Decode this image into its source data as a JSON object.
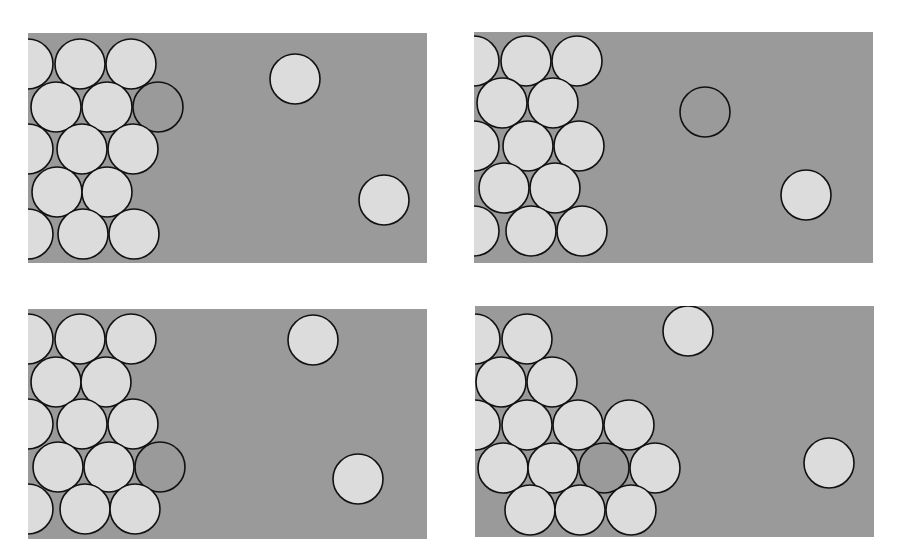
{
  "figure": {
    "width": 897,
    "height": 560,
    "colors": {
      "background": "#ffffff",
      "panel": "#9a9a9a",
      "atom_light": "#dcdcdc",
      "atom_dark": "#9a9a9a",
      "outline": "#111111"
    },
    "radius": 25,
    "panels": [
      {
        "name": "panel-top-left",
        "rect": {
          "x": 28,
          "y": 33,
          "w": 399,
          "h": 230
        },
        "atoms": [
          {
            "x": 28,
            "y": 64,
            "type": "light"
          },
          {
            "x": 80,
            "y": 64,
            "type": "light"
          },
          {
            "x": 131,
            "y": 64,
            "type": "light"
          },
          {
            "x": 56,
            "y": 107,
            "type": "light"
          },
          {
            "x": 107,
            "y": 107,
            "type": "light"
          },
          {
            "x": 158,
            "y": 107,
            "type": "dark"
          },
          {
            "x": 28,
            "y": 149,
            "type": "light"
          },
          {
            "x": 82,
            "y": 149,
            "type": "light"
          },
          {
            "x": 133,
            "y": 149,
            "type": "light"
          },
          {
            "x": 57,
            "y": 192,
            "type": "light"
          },
          {
            "x": 107,
            "y": 192,
            "type": "light"
          },
          {
            "x": 28,
            "y": 234,
            "type": "light"
          },
          {
            "x": 83,
            "y": 234,
            "type": "light"
          },
          {
            "x": 134,
            "y": 234,
            "type": "light"
          },
          {
            "x": 295,
            "y": 79,
            "type": "light"
          },
          {
            "x": 384,
            "y": 200,
            "type": "light"
          }
        ]
      },
      {
        "name": "panel-top-right",
        "rect": {
          "x": 474,
          "y": 32,
          "w": 399,
          "h": 231
        },
        "atoms": [
          {
            "x": 474,
            "y": 61,
            "type": "light"
          },
          {
            "x": 526,
            "y": 61,
            "type": "light"
          },
          {
            "x": 577,
            "y": 61,
            "type": "light"
          },
          {
            "x": 502,
            "y": 103,
            "type": "light"
          },
          {
            "x": 553,
            "y": 103,
            "type": "light"
          },
          {
            "x": 474,
            "y": 146,
            "type": "light"
          },
          {
            "x": 528,
            "y": 146,
            "type": "light"
          },
          {
            "x": 579,
            "y": 146,
            "type": "light"
          },
          {
            "x": 504,
            "y": 188,
            "type": "light"
          },
          {
            "x": 555,
            "y": 188,
            "type": "light"
          },
          {
            "x": 474,
            "y": 231,
            "type": "light"
          },
          {
            "x": 531,
            "y": 231,
            "type": "light"
          },
          {
            "x": 582,
            "y": 231,
            "type": "light"
          },
          {
            "x": 705,
            "y": 112,
            "type": "dark"
          },
          {
            "x": 806,
            "y": 195,
            "type": "light"
          }
        ]
      },
      {
        "name": "panel-bottom-left",
        "rect": {
          "x": 28,
          "y": 309,
          "w": 399,
          "h": 230
        },
        "atoms": [
          {
            "x": 28,
            "y": 339,
            "type": "light"
          },
          {
            "x": 80,
            "y": 339,
            "type": "light"
          },
          {
            "x": 131,
            "y": 339,
            "type": "light"
          },
          {
            "x": 56,
            "y": 382,
            "type": "light"
          },
          {
            "x": 106,
            "y": 382,
            "type": "light"
          },
          {
            "x": 28,
            "y": 424,
            "type": "light"
          },
          {
            "x": 82,
            "y": 424,
            "type": "light"
          },
          {
            "x": 133,
            "y": 424,
            "type": "light"
          },
          {
            "x": 58,
            "y": 467,
            "type": "light"
          },
          {
            "x": 109,
            "y": 467,
            "type": "light"
          },
          {
            "x": 160,
            "y": 467,
            "type": "dark"
          },
          {
            "x": 28,
            "y": 509,
            "type": "light"
          },
          {
            "x": 85,
            "y": 509,
            "type": "light"
          },
          {
            "x": 135,
            "y": 509,
            "type": "light"
          },
          {
            "x": 313,
            "y": 340,
            "type": "light"
          },
          {
            "x": 358,
            "y": 479,
            "type": "light"
          }
        ]
      },
      {
        "name": "panel-bottom-right",
        "rect": {
          "x": 475,
          "y": 306,
          "w": 399,
          "h": 231
        },
        "atoms": [
          {
            "x": 475,
            "y": 339,
            "type": "light"
          },
          {
            "x": 527,
            "y": 339,
            "type": "light"
          },
          {
            "x": 501,
            "y": 382,
            "type": "light"
          },
          {
            "x": 552,
            "y": 382,
            "type": "light"
          },
          {
            "x": 475,
            "y": 425,
            "type": "light"
          },
          {
            "x": 527,
            "y": 425,
            "type": "light"
          },
          {
            "x": 578,
            "y": 425,
            "type": "light"
          },
          {
            "x": 629,
            "y": 425,
            "type": "light"
          },
          {
            "x": 503,
            "y": 468,
            "type": "light"
          },
          {
            "x": 553,
            "y": 468,
            "type": "light"
          },
          {
            "x": 604,
            "y": 468,
            "type": "dark"
          },
          {
            "x": 655,
            "y": 468,
            "type": "light"
          },
          {
            "x": 530,
            "y": 510,
            "type": "light"
          },
          {
            "x": 580,
            "y": 510,
            "type": "light"
          },
          {
            "x": 631,
            "y": 510,
            "type": "light"
          },
          {
            "x": 688,
            "y": 331,
            "type": "light"
          },
          {
            "x": 829,
            "y": 463,
            "type": "light"
          }
        ]
      }
    ]
  }
}
